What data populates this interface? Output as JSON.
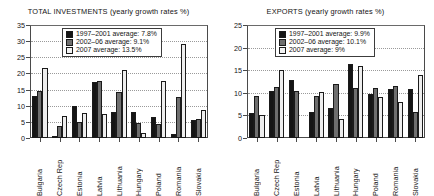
{
  "chart_data": [
    {
      "type": "bar",
      "title": "TOTAL INVESTMENTS (yearly growth rates %)",
      "xlabel": "",
      "ylabel": "",
      "ylim": [
        0,
        35
      ],
      "yticks": [
        0,
        5,
        10,
        15,
        20,
        25,
        30,
        35
      ],
      "grid": true,
      "legend_position": "top-center",
      "categories": [
        "Bulgaria",
        "Czech Rep",
        "Estonia",
        "Latvia",
        "Lithuania",
        "Hungary",
        "Poland",
        "Romania",
        "Slovakia"
      ],
      "series": [
        {
          "name": "1997–2001 average: 7.8%",
          "color": "#151515",
          "values": [
            13.0,
            0.4,
            10.0,
            17.4,
            8.2,
            8.2,
            6.6,
            1.2,
            5.7
          ]
        },
        {
          "name": "2002–06 average: 9.1%",
          "color": "#6e6e6e",
          "values": [
            14.7,
            3.7,
            5.1,
            17.7,
            14.3,
            4.5,
            4.2,
            12.8,
            5.9
          ]
        },
        {
          "name": "2007 average: 13.5%",
          "color": "#eeeeee",
          "values": [
            21.8,
            6.8,
            7.6,
            7.4,
            21.0,
            1.4,
            17.8,
            29.1,
            8.7
          ]
        }
      ]
    },
    {
      "type": "bar",
      "title": "EXPORTS (yearly growth rates %)",
      "xlabel": "",
      "ylabel": "",
      "ylim": [
        0,
        25
      ],
      "yticks": [
        0,
        5,
        10,
        15,
        20,
        25
      ],
      "grid": true,
      "legend_position": "top-center",
      "categories": [
        "Bulgaria",
        "Czech Rep",
        "Estonia",
        "Latvia",
        "Lithuania",
        "Hungary",
        "Poland",
        "Romania",
        "Slovakia"
      ],
      "series": [
        {
          "name": "1997–2001 average: 9.9%",
          "color": "#151515",
          "values": [
            5.6,
            10.3,
            12.9,
            5.8,
            6.7,
            16.4,
            9.7,
            10.8,
            10.8
          ]
        },
        {
          "name": "2002–06 average: 10.1%",
          "color": "#6e6e6e",
          "values": [
            9.2,
            11.3,
            10.4,
            9.2,
            12.0,
            11.0,
            11.0,
            11.5,
            5.7
          ]
        },
        {
          "name": "2007 average: 9%",
          "color": "#eeeeee",
          "values": [
            5.2,
            15.0,
            0.0,
            10.1,
            4.3,
            16.0,
            9.1,
            8.0,
            13.9
          ]
        }
      ]
    }
  ]
}
